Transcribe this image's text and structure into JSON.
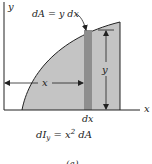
{
  "figure": {
    "axes": {
      "y_label": "y",
      "x_label": "x"
    },
    "element_label": "dA = y dx",
    "height_label": "y",
    "distance_label": "x",
    "width_label": "dx",
    "equation": {
      "lhs": "dI",
      "sub": "y",
      "eq": " = x",
      "sup": "2",
      "rhs": " dA"
    },
    "caption": "(a)",
    "colors": {
      "region_fill": "#c4c4c4",
      "strip_fill": "#8e8e8e",
      "line": "#222222"
    }
  }
}
